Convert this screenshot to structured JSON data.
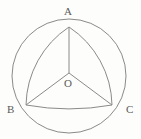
{
  "figure": {
    "background_color": "#fdfdfb",
    "stroke_color": "#8a8a8a",
    "label_color": "#5a5a5a",
    "stroke_width": 1
  },
  "labels": {
    "a": "A",
    "b": "B",
    "c": "C",
    "o": "O"
  },
  "geometry": {
    "circle": {
      "center_x": 69,
      "center_y": 76,
      "radius": 57
    },
    "vertices": {
      "a": {
        "x": 69,
        "y": 27
      },
      "b": {
        "x": 26,
        "y": 105
      },
      "c": {
        "x": 112,
        "y": 105
      },
      "o": {
        "x": 69,
        "y": 73
      }
    },
    "arcs": {
      "ab_bulge_radius": 96,
      "ac_bulge_radius": 96,
      "bc_bulge_radius": 240
    }
  }
}
